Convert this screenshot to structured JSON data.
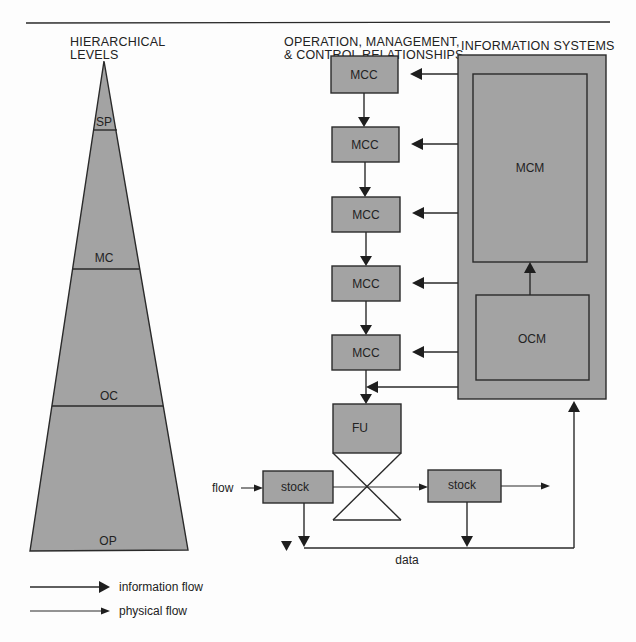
{
  "headers": {
    "hierarchical_line1": "HIERARCHICAL",
    "hierarchical_line2": "LEVELS",
    "operation_line1": "OPERATION, MANAGEMENT,",
    "operation_line2": "& CONTROL RELATIONSHIPS",
    "information_systems": "INFORMATION SYSTEMS"
  },
  "pyramid": {
    "levels": [
      {
        "label": "SP"
      },
      {
        "label": "MC"
      },
      {
        "label": "OC"
      },
      {
        "label": "OP"
      }
    ]
  },
  "mcc_boxes": [
    {
      "label": "MCC"
    },
    {
      "label": "MCC"
    },
    {
      "label": "MCC"
    },
    {
      "label": "MCC"
    },
    {
      "label": "MCC"
    }
  ],
  "info_system": {
    "mcm": "MCM",
    "ocm": "OCM"
  },
  "physical": {
    "fu": "FU",
    "stock_left": "stock",
    "stock_right": "stock",
    "flow_label": "flow",
    "data_label": "data"
  },
  "legend": {
    "information_flow": "information flow",
    "physical_flow": "physical flow"
  },
  "colors": {
    "box_fill": "#a3a3a3",
    "stroke": "#2a2a2a"
  }
}
